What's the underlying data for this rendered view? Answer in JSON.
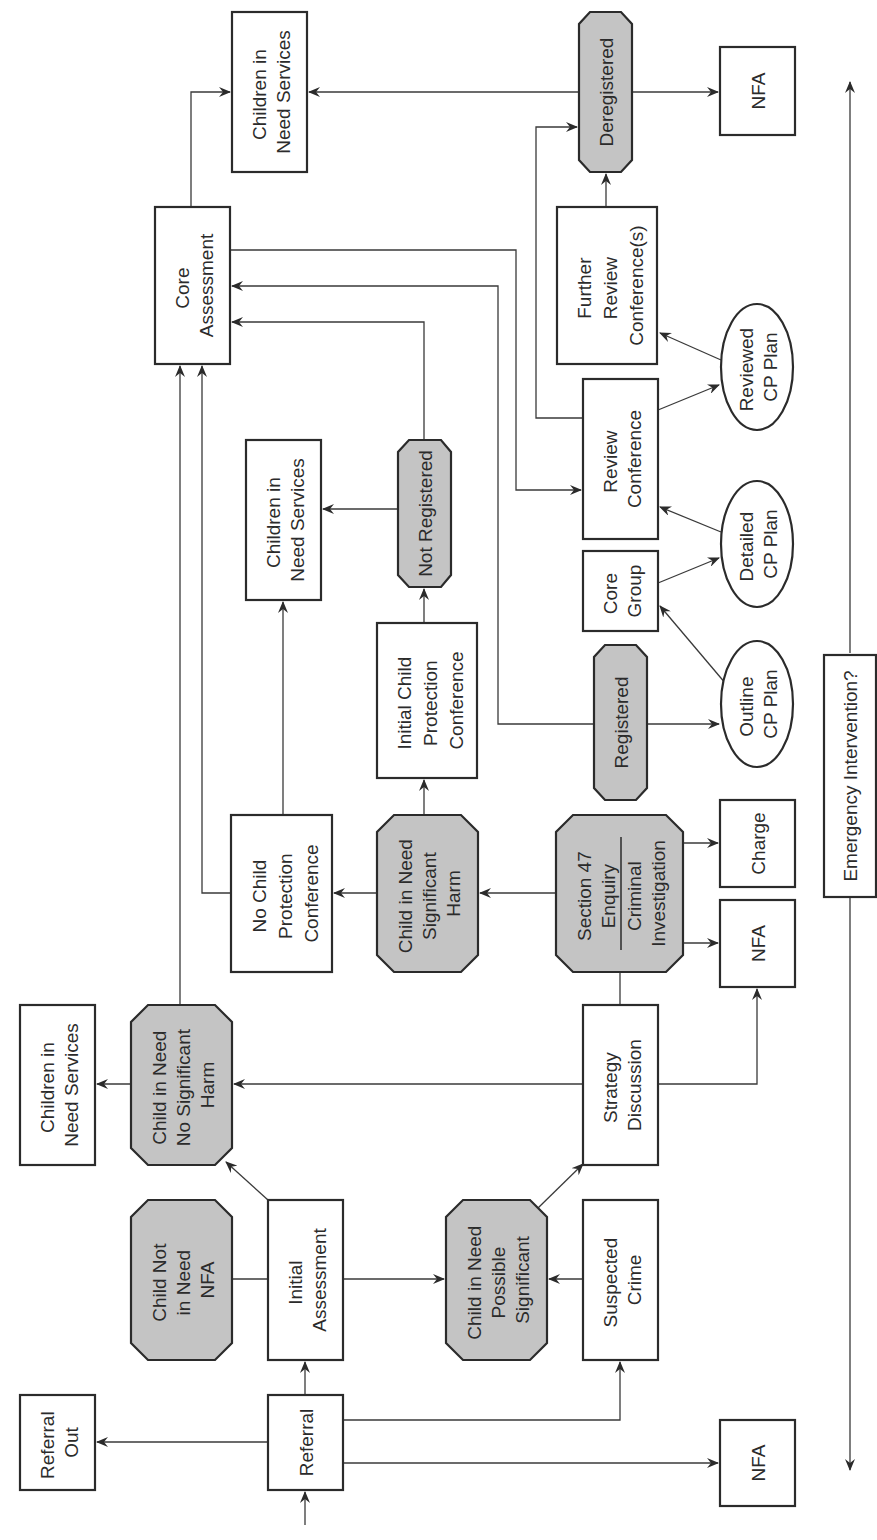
{
  "diagram": {
    "orientation": "rotated-90-counterclockwise",
    "colors": {
      "stroke": "#2b2b2b",
      "decision_fill": "#c4c4c4",
      "box_fill": "#ffffff",
      "background": "#ffffff"
    },
    "nodes": {
      "referral_out": {
        "type": "box",
        "lines": [
          "Referral",
          "Out"
        ]
      },
      "referral": {
        "type": "box",
        "lines": [
          "Referral"
        ]
      },
      "nfa_referral": {
        "type": "box",
        "lines": [
          "NFA"
        ]
      },
      "child_not_in_need": {
        "type": "octagon",
        "lines": [
          "Child Not",
          "in Need",
          "NFA"
        ]
      },
      "initial_assessment": {
        "type": "box",
        "lines": [
          "Initial",
          "Assessment"
        ]
      },
      "child_possible_significant": {
        "type": "octagon",
        "lines": [
          "Child in Need",
          "Possible",
          "Significant"
        ]
      },
      "suspected_crime": {
        "type": "box",
        "lines": [
          "Suspected",
          "Crime"
        ]
      },
      "cin_services_1": {
        "type": "box",
        "lines": [
          "Children in",
          "Need Services"
        ]
      },
      "child_no_significant_harm": {
        "type": "octagon",
        "lines": [
          "Child in Need",
          "No Significant",
          "Harm"
        ]
      },
      "strategy_discussion": {
        "type": "box",
        "lines": [
          "Strategy",
          "Discussion"
        ]
      },
      "no_cp_conference": {
        "type": "box",
        "lines": [
          "No Child",
          "Protection",
          "Conference"
        ]
      },
      "child_significant_harm": {
        "type": "octagon",
        "lines": [
          "Child in Need",
          "Significant",
          "Harm"
        ]
      },
      "section47": {
        "type": "octagon",
        "lines": [
          "Section 47",
          "Enquiry",
          "Criminal",
          "Investigation"
        ]
      },
      "nfa_section47": {
        "type": "box",
        "lines": [
          "NFA"
        ]
      },
      "charge": {
        "type": "box",
        "lines": [
          "Charge"
        ]
      },
      "initial_cp_conference": {
        "type": "box",
        "lines": [
          "Initial Child",
          "Protection",
          "Conference"
        ]
      },
      "cin_services_2": {
        "type": "box",
        "lines": [
          "Children in",
          "Need Services"
        ]
      },
      "not_registered": {
        "type": "octagon",
        "lines": [
          "Not Registered"
        ]
      },
      "registered": {
        "type": "octagon",
        "lines": [
          "Registered"
        ]
      },
      "outline_cp_plan": {
        "type": "ellipse",
        "lines": [
          "Outline",
          "CP Plan"
        ]
      },
      "core_group": {
        "type": "box",
        "lines": [
          "Core",
          "Group"
        ]
      },
      "detailed_cp_plan": {
        "type": "ellipse",
        "lines": [
          "Detailed",
          "CP Plan"
        ]
      },
      "review_conference": {
        "type": "box",
        "lines": [
          "Review",
          "Conference"
        ]
      },
      "reviewed_cp_plan": {
        "type": "ellipse",
        "lines": [
          "Reviewed",
          "CP Plan"
        ]
      },
      "core_assessment": {
        "type": "box",
        "lines": [
          "Core",
          "Assessment"
        ]
      },
      "further_review": {
        "type": "box",
        "lines": [
          "Further",
          "Review",
          "Conference(s)"
        ]
      },
      "cin_services_3": {
        "type": "box",
        "lines": [
          "Children in",
          "Need Services"
        ]
      },
      "deregistered": {
        "type": "octagon",
        "lines": [
          "Deregistered"
        ]
      },
      "nfa_deregistered": {
        "type": "box",
        "lines": [
          "NFA"
        ]
      },
      "emergency_intervention": {
        "type": "box",
        "lines": [
          "Emergency Intervention?"
        ]
      }
    },
    "edges": [
      [
        "entry",
        "referral"
      ],
      [
        "referral",
        "referral_out"
      ],
      [
        "referral",
        "initial_assessment"
      ],
      [
        "referral",
        "suspected_crime"
      ],
      [
        "referral",
        "nfa_referral"
      ],
      [
        "initial_assessment",
        "child_not_in_need"
      ],
      [
        "initial_assessment",
        "child_no_significant_harm"
      ],
      [
        "initial_assessment",
        "child_possible_significant"
      ],
      [
        "suspected_crime",
        "child_possible_significant"
      ],
      [
        "child_possible_significant",
        "strategy_discussion"
      ],
      [
        "child_no_significant_harm",
        "cin_services_1"
      ],
      [
        "child_no_significant_harm",
        "core_assessment"
      ],
      [
        "strategy_discussion",
        "child_no_significant_harm"
      ],
      [
        "strategy_discussion",
        "section47"
      ],
      [
        "strategy_discussion",
        "nfa_section47"
      ],
      [
        "section47",
        "child_significant_harm"
      ],
      [
        "section47",
        "nfa_section47"
      ],
      [
        "section47",
        "charge"
      ],
      [
        "child_significant_harm",
        "no_cp_conference"
      ],
      [
        "child_significant_harm",
        "initial_cp_conference"
      ],
      [
        "no_cp_conference",
        "cin_services_2"
      ],
      [
        "no_cp_conference",
        "core_assessment"
      ],
      [
        "initial_cp_conference",
        "not_registered"
      ],
      [
        "not_registered",
        "cin_services_2"
      ],
      [
        "not_registered",
        "core_assessment"
      ],
      [
        "registered",
        "core_assessment"
      ],
      [
        "registered",
        "outline_cp_plan"
      ],
      [
        "outline_cp_plan",
        "core_group"
      ],
      [
        "core_group",
        "detailed_cp_plan"
      ],
      [
        "detailed_cp_plan",
        "review_conference"
      ],
      [
        "core_assessment",
        "review_conference"
      ],
      [
        "core_assessment",
        "cin_services_3"
      ],
      [
        "review_conference",
        "reviewed_cp_plan"
      ],
      [
        "review_conference",
        "deregistered"
      ],
      [
        "reviewed_cp_plan",
        "further_review"
      ],
      [
        "further_review",
        "deregistered"
      ],
      [
        "deregistered",
        "cin_services_3"
      ],
      [
        "deregistered",
        "nfa_deregistered"
      ],
      [
        "emergency_intervention",
        "timeline-both-directions"
      ]
    ]
  }
}
